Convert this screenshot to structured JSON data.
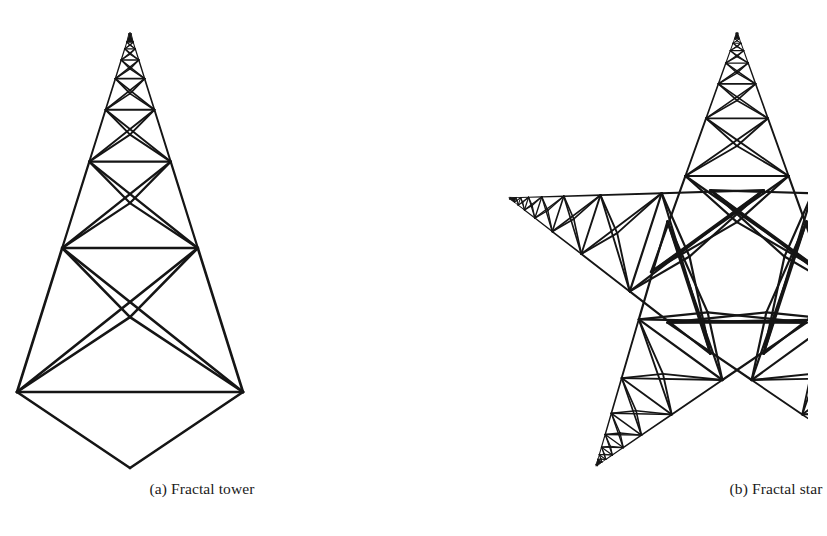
{
  "figure": {
    "background_color": "#ffffff",
    "ink_color": "#151515",
    "panels": [
      {
        "id": "a",
        "label": "(a) Fractal tower",
        "figure_name": "fractal-tower",
        "caption_prefix": "(a)",
        "caption_text": "Fractal tower"
      },
      {
        "id": "b",
        "label": "(b) Fractal star",
        "figure_name": "fractal-star",
        "caption_prefix": "(b)",
        "caption_text": "Fractal star"
      }
    ]
  },
  "chart_data": {
    "type": "diagram",
    "title": "",
    "subtitle": "",
    "figures": [
      {
        "name": "fractal tower",
        "caption": "(a) Fractal tower",
        "geometry": "recursive-triangular-truss",
        "apex": [
          130,
          32
        ],
        "base_left": [
          17,
          392
        ],
        "base_right": [
          243,
          392
        ],
        "bottom_vertex": [
          130,
          468
        ],
        "base_half_width": 113,
        "levels": 8,
        "scale_ratio": 0.6,
        "bar_levels_y": [
          392,
          258,
          166,
          108,
          72,
          50,
          38,
          33
        ],
        "bar_half_widths": [
          113,
          68,
          42,
          26,
          16,
          10,
          6,
          4
        ],
        "module": "each level: horizontal chord, side rails to next chord, X diagonals, and a V down to the chord mid-vertex"
      },
      {
        "name": "fractal star",
        "caption": "(b) Fractal star",
        "geometry": "five-arm-recursive-truss-star",
        "center": [
          737,
          272
        ],
        "arm_count": 5,
        "arm_length": 240,
        "arm_half_width": 86,
        "arm_tips": [
          [
            737,
            32
          ],
          [
            505,
            208
          ],
          [
            905,
            208
          ],
          [
            597,
            478
          ],
          [
            877,
            478
          ]
        ],
        "tip_angles_deg": [
          270,
          342,
          54,
          126,
          198
        ],
        "levels": 8,
        "scale_ratio": 0.6,
        "clipped_at_right_edge": true,
        "inner_polygon": "pentagon"
      }
    ],
    "xlabel": "",
    "ylabel": "",
    "grid": false,
    "legend": null
  }
}
